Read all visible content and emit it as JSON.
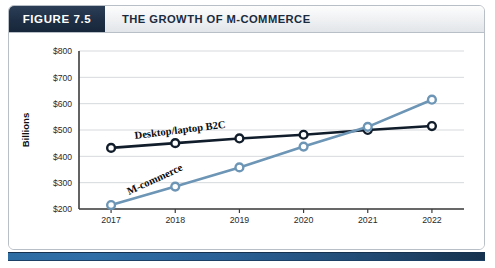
{
  "figure": {
    "number_label": "FIGURE 7.5",
    "title": "THE GROWTH OF M-COMMERCE"
  },
  "colors": {
    "header_dark_navy": "#1e2f45",
    "header_light": "#eef0f2",
    "desktop_series": "#111d2b",
    "mcommerce_series": "#6d95b5",
    "gridline": "#d6d9dd",
    "axis": "#3c3c3c",
    "bottom_rule": "#2a5f93"
  },
  "chart_data": {
    "type": "line",
    "title": "THE GROWTH OF M-COMMERCE",
    "xlabel": "",
    "ylabel": "Billions",
    "categories": [
      "2017",
      "2018",
      "2019",
      "2020",
      "2021",
      "2022"
    ],
    "x": [
      2017,
      2018,
      2019,
      2020,
      2021,
      2022
    ],
    "ylim": [
      200,
      800
    ],
    "ytick_labels": [
      "$800",
      "$700",
      "$600",
      "$500",
      "$400",
      "$300",
      "$200"
    ],
    "ytick_values": [
      800,
      700,
      600,
      500,
      400,
      300,
      200
    ],
    "grid": true,
    "legend": "inline-labels",
    "series": [
      {
        "name": "Desktop/laptop B2C",
        "color": "#111d2b",
        "values": [
          432,
          450,
          468,
          482,
          500,
          515
        ]
      },
      {
        "name": "M-commerce",
        "color": "#6d95b5",
        "values": [
          215,
          285,
          358,
          437,
          512,
          615
        ]
      }
    ],
    "annotations": [
      {
        "text": "Desktop/laptop B2C",
        "series": "Desktop/laptop B2C"
      },
      {
        "text": "M-commerce",
        "series": "M-commerce"
      }
    ]
  }
}
